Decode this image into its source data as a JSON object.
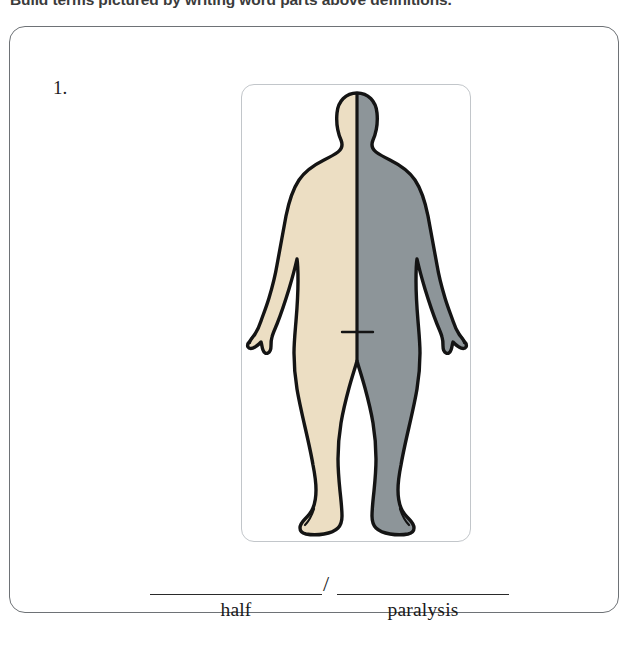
{
  "instruction": {
    "text": "Build terms pictured by writing word parts above definitions."
  },
  "exercise": {
    "number": "1.",
    "answer_prompt": {
      "separator": "/",
      "blanks": [
        {
          "value": "",
          "definition": "half"
        },
        {
          "value": "",
          "definition": "paralysis"
        }
      ]
    }
  },
  "figure": {
    "name": "human-body-posterior-hemiplegia",
    "colors": {
      "left_half": "#ecdec3",
      "right_half": "#8d9599",
      "outline": "#141414",
      "midline": "#141414",
      "card_border": "#c2c6ca",
      "box_border": "#6e7276",
      "background": "#ffffff"
    }
  }
}
